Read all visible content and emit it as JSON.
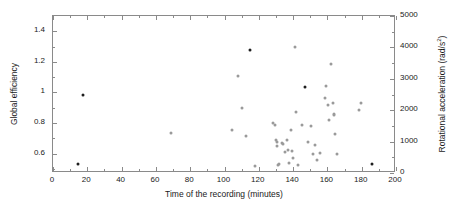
{
  "chart_data": {
    "type": "scatter",
    "title": "",
    "xlabel": "Time of the recording (minutes)",
    "ylabel": "Global efficiency",
    "ylabel_right": "Rotational acceleration (rad/s",
    "ylabel_right_sup": "2",
    "ylabel_right_close": ")",
    "xlim": [
      0,
      200
    ],
    "ylim": [
      0.4733,
      1.5
    ],
    "ylim_right": [
      0,
      5000
    ],
    "grid": false,
    "legend": null,
    "xticks": [
      0,
      20,
      40,
      60,
      80,
      100,
      120,
      140,
      160,
      180,
      200
    ],
    "xtick_labels": [
      "0",
      "20",
      "40",
      "60",
      "80",
      "100",
      "120",
      "140",
      "160",
      "180",
      "200"
    ],
    "xticks_minor": [
      10,
      30,
      50,
      70,
      90,
      110,
      130,
      150,
      170,
      190
    ],
    "yticks": [
      0.6,
      0.8,
      1.0,
      1.2,
      1.4
    ],
    "ytick_labels": [
      "0.6",
      "0.8",
      "1",
      "1.2",
      "1.4"
    ],
    "yticks_minor": [
      0.5,
      0.7,
      0.9,
      1.1,
      1.3,
      1.5
    ],
    "yticks_right": [
      0,
      1000,
      2000,
      3000,
      4000,
      5000
    ],
    "ytick_labels_right": [
      "0",
      "1000",
      "2000",
      "3000",
      "4000",
      "5000"
    ],
    "yticks_right_minor": [
      500,
      1500,
      2500,
      3500,
      4500
    ],
    "marker": "circle",
    "marker_color": "#9a9a9a",
    "marker_color_dark": "#1e1e1e",
    "points": [
      {
        "x": 14.5,
        "y": 0.535,
        "dark": true
      },
      {
        "x": 17.3,
        "y": 0.982,
        "dark": true
      },
      {
        "x": 68.8,
        "y": 0.733,
        "dark": false
      },
      {
        "x": 104.5,
        "y": 0.757,
        "dark": false
      },
      {
        "x": 107.8,
        "y": 1.105,
        "dark": false
      },
      {
        "x": 110.0,
        "y": 0.9,
        "dark": false
      },
      {
        "x": 112.4,
        "y": 0.712,
        "dark": false
      },
      {
        "x": 114.8,
        "y": 1.28,
        "dark": true
      },
      {
        "x": 117.5,
        "y": 0.52,
        "dark": false
      },
      {
        "x": 128.0,
        "y": 0.8,
        "dark": false
      },
      {
        "x": 129.2,
        "y": 0.788,
        "dark": false
      },
      {
        "x": 129.8,
        "y": 0.69,
        "dark": false
      },
      {
        "x": 130.4,
        "y": 0.676,
        "dark": false
      },
      {
        "x": 130.9,
        "y": 0.652,
        "dark": false
      },
      {
        "x": 131.2,
        "y": 0.528,
        "dark": false
      },
      {
        "x": 131.6,
        "y": 0.533,
        "dark": false
      },
      {
        "x": 133.3,
        "y": 0.668,
        "dark": false
      },
      {
        "x": 133.9,
        "y": 0.66,
        "dark": false
      },
      {
        "x": 135.4,
        "y": 0.608,
        "dark": false
      },
      {
        "x": 136.2,
        "y": 0.69,
        "dark": false
      },
      {
        "x": 137.3,
        "y": 0.622,
        "dark": false
      },
      {
        "x": 137.9,
        "y": 0.537,
        "dark": false
      },
      {
        "x": 139.0,
        "y": 0.755,
        "dark": false
      },
      {
        "x": 139.6,
        "y": 0.616,
        "dark": false
      },
      {
        "x": 140.1,
        "y": 0.573,
        "dark": false
      },
      {
        "x": 141.0,
        "y": 1.3,
        "dark": false
      },
      {
        "x": 141.4,
        "y": 0.873,
        "dark": false
      },
      {
        "x": 142.7,
        "y": 0.527,
        "dark": false
      },
      {
        "x": 145.0,
        "y": 0.784,
        "dark": false
      },
      {
        "x": 146.7,
        "y": 1.035,
        "dark": true
      },
      {
        "x": 148.6,
        "y": 0.678,
        "dark": false
      },
      {
        "x": 150.6,
        "y": 0.78,
        "dark": false
      },
      {
        "x": 151.4,
        "y": 0.596,
        "dark": false
      },
      {
        "x": 152.9,
        "y": 0.655,
        "dark": false
      },
      {
        "x": 153.8,
        "y": 0.56,
        "dark": false
      },
      {
        "x": 155.6,
        "y": 0.607,
        "dark": false
      },
      {
        "x": 158.4,
        "y": 0.963,
        "dark": false
      },
      {
        "x": 159.2,
        "y": 1.04,
        "dark": false
      },
      {
        "x": 160.3,
        "y": 0.917,
        "dark": false
      },
      {
        "x": 161.0,
        "y": 0.82,
        "dark": false
      },
      {
        "x": 162.2,
        "y": 1.188,
        "dark": false
      },
      {
        "x": 163.0,
        "y": 0.93,
        "dark": false
      },
      {
        "x": 163.6,
        "y": 0.862,
        "dark": false
      },
      {
        "x": 164.1,
        "y": 0.855,
        "dark": false
      },
      {
        "x": 164.6,
        "y": 0.728,
        "dark": false
      },
      {
        "x": 165.4,
        "y": 0.6,
        "dark": false
      },
      {
        "x": 178.6,
        "y": 0.888,
        "dark": false
      },
      {
        "x": 179.4,
        "y": 0.932,
        "dark": false
      },
      {
        "x": 185.8,
        "y": 0.535,
        "dark": true
      }
    ]
  }
}
